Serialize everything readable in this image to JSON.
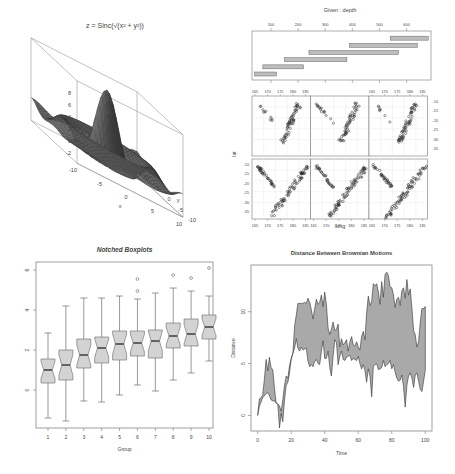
{
  "chart_data": [
    {
      "type": "surface",
      "title": "z = Sinc(√(x² + y²))",
      "xlabel": "x",
      "ylabel": "y",
      "zlabel": "z",
      "x_ticks": [
        "-10",
        "-5",
        "0",
        "5",
        "10"
      ],
      "y_ticks": [
        "-10",
        "-5",
        "0",
        "5",
        "10"
      ],
      "z_ticks": [
        "-2",
        "0",
        "2",
        "4",
        "6",
        "8"
      ],
      "xlim": [
        -10,
        10
      ],
      "ylim": [
        -10,
        10
      ],
      "zlim": [
        -2,
        8
      ],
      "color": "#555555"
    },
    {
      "type": "scatter",
      "subtype": "coplot",
      "given_title": "Given : depth",
      "given_ticks": [
        "100",
        "200",
        "300",
        "400",
        "500",
        "600"
      ],
      "given_intervals": [
        [
          40,
          120
        ],
        [
          70,
          220
        ],
        [
          150,
          380
        ],
        [
          240,
          570
        ],
        [
          390,
          640
        ],
        [
          540,
          680
        ]
      ],
      "xlabel": "long",
      "ylabel": "lat",
      "x_ticks": [
        "165",
        "170",
        "175",
        "180",
        "185"
      ],
      "y_ticks": [
        "-10",
        "-15",
        "-20",
        "-25",
        "-30",
        "-35"
      ],
      "panels": 6,
      "layout": [
        2,
        3
      ]
    },
    {
      "type": "boxplot",
      "title": "Notched Boxplots",
      "xlabel": "Group",
      "ylabel": "",
      "categories": [
        "1",
        "2",
        "3",
        "4",
        "5",
        "6",
        "7",
        "8",
        "9",
        "10"
      ],
      "y_ticks": [
        "0",
        "2",
        "4",
        "6"
      ],
      "ylim": [
        -1.9,
        6.4
      ],
      "boxes": [
        {
          "min": -1.4,
          "q1": 0.35,
          "median": 1.0,
          "q3": 1.55,
          "max": 2.85,
          "outliers": []
        },
        {
          "min": -1.55,
          "q1": 0.5,
          "median": 1.25,
          "q3": 2.0,
          "max": 4.2,
          "outliers": []
        },
        {
          "min": -0.55,
          "q1": 1.1,
          "median": 1.75,
          "q3": 2.55,
          "max": 4.6,
          "outliers": []
        },
        {
          "min": -0.6,
          "q1": 1.35,
          "median": 2.1,
          "q3": 2.65,
          "max": 4.6,
          "outliers": []
        },
        {
          "min": -0.25,
          "q1": 1.5,
          "median": 2.3,
          "q3": 2.95,
          "max": 4.7,
          "outliers": []
        },
        {
          "min": 0.25,
          "q1": 1.7,
          "median": 2.35,
          "q3": 2.95,
          "max": 4.55,
          "outliers": [
            4.95,
            5.55
          ]
        },
        {
          "min": -0.05,
          "q1": 1.6,
          "median": 2.45,
          "q3": 3.0,
          "max": 4.85,
          "outliers": []
        },
        {
          "min": 0.5,
          "q1": 2.1,
          "median": 2.7,
          "q3": 3.35,
          "max": 5.1,
          "outliers": [
            5.75
          ]
        },
        {
          "min": 0.85,
          "q1": 2.2,
          "median": 2.8,
          "q3": 3.55,
          "max": 4.95,
          "outliers": [
            5.6
          ]
        },
        {
          "min": 1.45,
          "q1": 2.55,
          "median": 3.15,
          "q3": 3.75,
          "max": 4.7,
          "outliers": [
            6.1
          ]
        }
      ],
      "box_fill": "#d3d3d3"
    },
    {
      "type": "area",
      "title": "Distance Between Brownian Motions",
      "xlabel": "Time",
      "ylabel": "Distance",
      "x_ticks": [
        "0",
        "20",
        "40",
        "60",
        "80",
        "100"
      ],
      "y_ticks": [
        "0",
        "5",
        "10"
      ],
      "xlim": [
        -4,
        104
      ],
      "ylim": [
        -1.5,
        14.5
      ],
      "x": [
        0,
        1,
        2,
        3,
        4,
        5,
        6,
        7,
        8,
        9,
        10,
        11,
        12,
        13,
        14,
        15,
        16,
        17,
        18,
        19,
        20,
        21,
        22,
        23,
        24,
        25,
        26,
        27,
        28,
        29,
        30,
        31,
        32,
        33,
        34,
        35,
        36,
        37,
        38,
        39,
        40,
        41,
        42,
        43,
        44,
        45,
        46,
        47,
        48,
        49,
        50,
        51,
        52,
        53,
        54,
        55,
        56,
        57,
        58,
        59,
        60,
        61,
        62,
        63,
        64,
        65,
        66,
        67,
        68,
        69,
        70,
        71,
        72,
        73,
        74,
        75,
        76,
        77,
        78,
        79,
        80,
        81,
        82,
        83,
        84,
        85,
        86,
        87,
        88,
        89,
        90,
        91,
        92,
        93,
        94,
        95,
        96,
        97,
        98,
        99,
        100
      ],
      "upper": [
        0,
        1.6,
        1.7,
        2.0,
        3.5,
        5.4,
        4.3,
        5.6,
        4.6,
        4.4,
        2.6,
        1.2,
        1.1,
        0.9,
        0.4,
        1.5,
        2.9,
        3.8,
        3.6,
        4.8,
        5.5,
        6.0,
        8.6,
        9.7,
        10.8,
        10.8,
        10.8,
        10.8,
        10.9,
        10.8,
        11.3,
        10.9,
        10.2,
        9.3,
        10.3,
        11.2,
        10.7,
        10.9,
        11.6,
        10.5,
        11.9,
        10.7,
        8.4,
        7.8,
        8.3,
        9.0,
        8.2,
        8.3,
        8.8,
        6.6,
        7.4,
        6.8,
        7.0,
        7.3,
        6.2,
        7.1,
        7.6,
        6.8,
        6.7,
        7.1,
        6.6,
        6.3,
        7.6,
        8.1,
        7.3,
        9.9,
        11.5,
        10.6,
        11.0,
        12.7,
        12.5,
        12.7,
        11.9,
        10.7,
        12.9,
        11.4,
        13.6,
        13.8,
        13.5,
        12.4,
        12.3,
        11.6,
        10.4,
        11.2,
        11.4,
        10.6,
        12.0,
        12.3,
        11.3,
        13.1,
        11.6,
        12.2,
        10.4,
        8.2,
        7.8,
        6.6,
        7.1,
        9.0,
        10.3,
        10.3,
        10.5
      ],
      "lower": [
        0,
        0.9,
        1.3,
        1.7,
        1.9,
        2.1,
        2.2,
        1.9,
        1.5,
        1.4,
        1.4,
        1.2,
        1.1,
        -1.2,
        0.2,
        -0.6,
        1.5,
        2.9,
        3.2,
        4.1,
        5.4,
        6.0,
        6.5,
        7.4,
        6.5,
        6.2,
        6.6,
        6.3,
        6.4,
        6.5,
        5.2,
        4.7,
        4.9,
        4.7,
        5.2,
        5.4,
        5.0,
        4.9,
        6.2,
        7.2,
        5.5,
        5.5,
        6.2,
        4.6,
        3.8,
        5.7,
        7.3,
        7.0,
        4.9,
        5.7,
        6.2,
        5.4,
        5.3,
        5.6,
        5.7,
        5.8,
        5.3,
        5.5,
        5.4,
        5.3,
        5.7,
        5.0,
        4.5,
        4.9,
        4.3,
        3.2,
        4.5,
        3.8,
        1.8,
        4.7,
        4.9,
        5.0,
        4.4,
        4.5,
        4.6,
        5.3,
        4.7,
        4.9,
        5.0,
        5.3,
        4.5,
        4.9,
        4.2,
        3.6,
        3.3,
        3.4,
        3.9,
        2.8,
        0.8,
        2.9,
        3.8,
        4.1,
        3.6,
        2.7,
        3.9,
        4.1,
        3.3,
        2.5,
        2.3,
        3.3,
        4.4
      ],
      "fill": "#a9a9a9"
    }
  ]
}
